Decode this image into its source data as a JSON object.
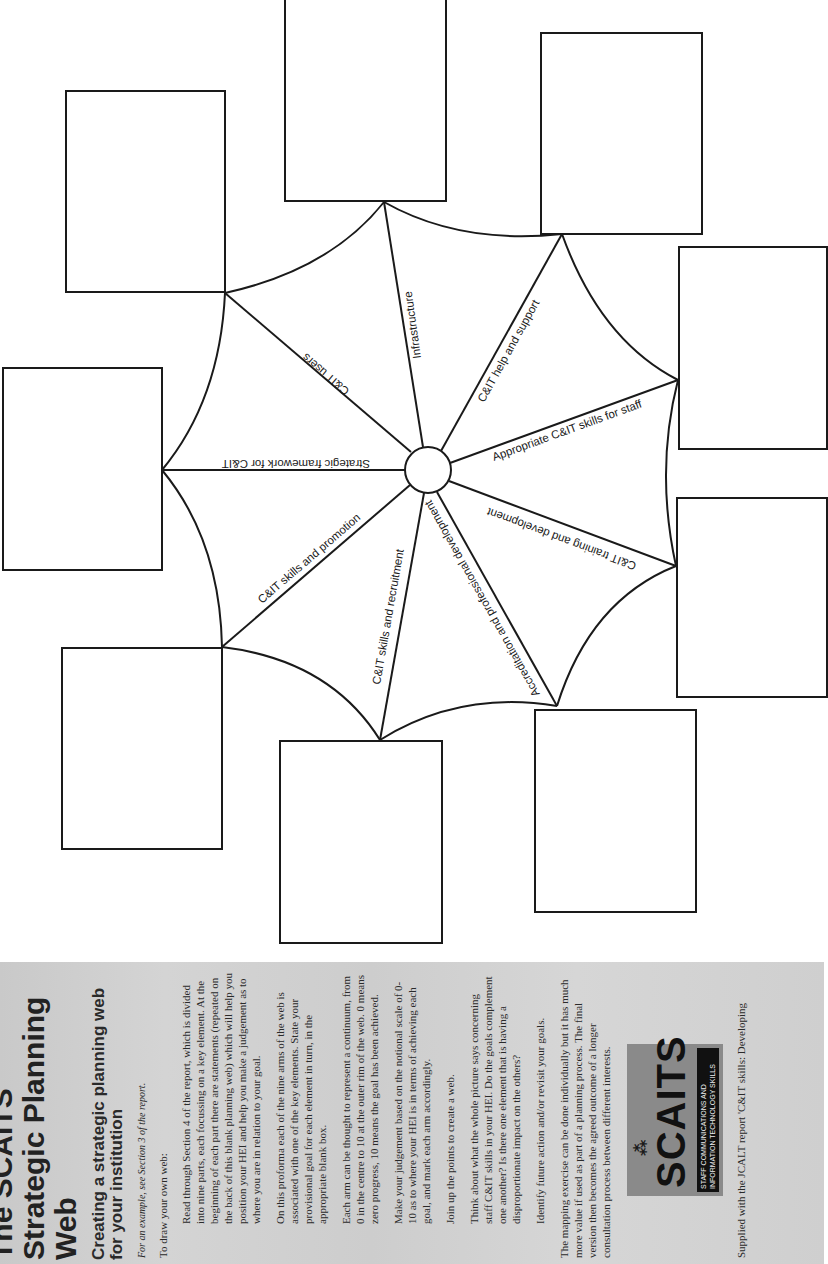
{
  "document": {
    "title": "The SCAITS Strategic Planning Web",
    "subtitle": "Creating a strategic planning web for your institution",
    "example_note": "For an example, see Section 3 of the report.",
    "intro": "To draw your own web:",
    "steps": [
      "Read through Section 4 of the report, which is divided into nine parts, each focussing on a key element. At the beginning of each part there are statements (repeated on the back of this blank planning web) which will help you position your HEI and help you make a judgement as to where you are in relation to your goal.",
      "On this proforma each of the nine arms of the web is associated with one of the key elements. State your provisional goal for each element in turn, in the appropriate blank box.",
      "Each arm can be thought to represent a continuum, from 0 in the centre to 10 at the outer rim of the web. 0 means zero progress, 10 means the goal has been achieved.",
      "Make your judgement based on the notional scale of 0-10 as to where your HEI is in terms of achieving each goal, and mark each arm accordingly.",
      "Join up the points to create a web.",
      "Think about what the whole picture says concerning staff C&IT skills in your HEI. Do the goals complement one another? Is there one element that is having a disproportionate impact on the others?",
      "Identify future action and/or revisit your goals."
    ],
    "closing": "The mapping exercise can be done individually but it has much more value if used as part of a planning process. The final version then becomes the agreed outcome of a longer consultation process between different interests.",
    "logo": {
      "wordmark": "SCAITS",
      "tagline": "STAFF COMMUNICATIONS AND INFORMATION TECHNOLOGY SKILLS"
    },
    "footer": "Supplied with the JCALT report 'C&IT skills: Developing"
  },
  "web": {
    "arms": [
      {
        "label": "Strategic framework for C&IT"
      },
      {
        "label": "C&IT users"
      },
      {
        "label": "Infrastructure"
      },
      {
        "label": "C&IT help and support"
      },
      {
        "label": "Appropriate C&IT skills for staff"
      },
      {
        "label": "C&IT training and development"
      },
      {
        "label": "Accreditation and professional development"
      },
      {
        "label": "C&IT skills and recruitment"
      },
      {
        "label": "C&IT skills and promotion"
      }
    ],
    "goal_boxes": 9
  }
}
